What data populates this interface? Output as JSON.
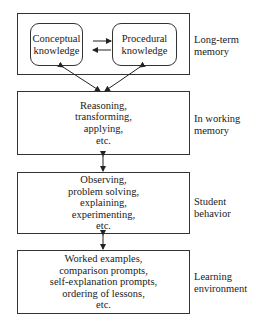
{
  "diagram": {
    "long_term_memory": {
      "label": [
        "Long-term",
        "memory"
      ],
      "conceptual": [
        "Conceptual",
        "knowledge"
      ],
      "procedural": [
        "Procedural",
        "knowledge"
      ]
    },
    "working_memory": {
      "label": [
        "In working",
        "memory"
      ],
      "lines": [
        "Reasoning,",
        "transforming,",
        "applying,",
        "etc."
      ]
    },
    "student_behavior": {
      "label": [
        "Student",
        "behavior"
      ],
      "lines": [
        "Observing,",
        "problem solving,",
        "explaining,",
        "experimenting,",
        "etc."
      ]
    },
    "learning_environment": {
      "label": [
        "Learning",
        "environment"
      ],
      "lines": [
        "Worked examples,",
        "comparison prompts,",
        "self-explanation prompts,",
        "ordering of lessons,",
        "etc."
      ]
    },
    "colors": {
      "stroke": "#333333",
      "text": "#1a1a1a",
      "background": "#ffffff"
    }
  }
}
